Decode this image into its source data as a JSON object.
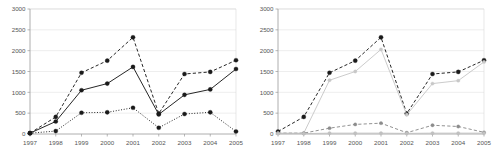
{
  "figure": {
    "panels": [
      "left-chart",
      "right-chart"
    ],
    "background_color": "#ffffff"
  },
  "chart_data": [
    {
      "panel": "left",
      "type": "line",
      "title": "",
      "xlabel": "",
      "ylabel": "",
      "x": [
        "1997",
        "1998",
        "1999",
        "2000",
        "2001",
        "2002",
        "2003",
        "2004",
        "2005"
      ],
      "categories": [
        "1997",
        "1998",
        "1999",
        "2000",
        "2001",
        "2002",
        "2003",
        "2004",
        "2005"
      ],
      "ylim": [
        0,
        3000
      ],
      "yticks": [
        0,
        500,
        1000,
        1500,
        2000,
        2500,
        3000
      ],
      "ytick_labels": [
        "0",
        "500",
        "1000",
        "1500",
        "2000",
        "2500",
        "3000"
      ],
      "grid": true,
      "legend": "none",
      "series": [
        {
          "name": "series-1-dashed",
          "style": "dashed",
          "color": "#1a1a1a",
          "marker": "circle",
          "values": [
            20,
            410,
            1470,
            1760,
            2320,
            490,
            1440,
            1490,
            1770
          ]
        },
        {
          "name": "series-2-solid",
          "style": "solid",
          "color": "#1a1a1a",
          "marker": "circle",
          "values": [
            20,
            300,
            1050,
            1210,
            1610,
            470,
            940,
            1070,
            1560
          ]
        },
        {
          "name": "series-3-dotted",
          "style": "dotted",
          "color": "#1a1a1a",
          "marker": "circle",
          "values": [
            20,
            70,
            510,
            520,
            630,
            150,
            480,
            520,
            60
          ]
        }
      ]
    },
    {
      "panel": "right",
      "type": "line",
      "title": "",
      "xlabel": "",
      "ylabel": "",
      "x": [
        "1997",
        "1998",
        "1999",
        "2000",
        "2001",
        "2002",
        "2003",
        "2004",
        "2005"
      ],
      "categories": [
        "1997",
        "1998",
        "1999",
        "2000",
        "2001",
        "2002",
        "2003",
        "2004",
        "2005"
      ],
      "ylim": [
        0,
        3000
      ],
      "yticks": [
        0,
        500,
        1000,
        1500,
        2000,
        2500,
        3000
      ],
      "ytick_labels": [
        "0",
        "500",
        "1000",
        "1500",
        "2000",
        "2500",
        "3000"
      ],
      "grid": true,
      "legend": "none",
      "series": [
        {
          "name": "series-1-black-dashed",
          "style": "dashed",
          "color": "#1a1a1a",
          "marker": "circle",
          "values": [
            60,
            410,
            1470,
            1760,
            2320,
            490,
            1440,
            1490,
            1770
          ]
        },
        {
          "name": "series-2-lightgray-solid",
          "style": "solid",
          "color": "#c8c8c8",
          "marker": "circle",
          "values": [
            20,
            20,
            1290,
            1500,
            2030,
            460,
            1210,
            1280,
            1730
          ]
        },
        {
          "name": "series-3-gray-dashed",
          "style": "dashed",
          "color": "#8c8c8c",
          "marker": "circle",
          "values": [
            20,
            20,
            140,
            230,
            260,
            30,
            210,
            180,
            40
          ]
        },
        {
          "name": "series-4-lightgray-flat",
          "style": "solid",
          "color": "#c0c0c0",
          "marker": "circle",
          "values": [
            10,
            10,
            20,
            20,
            20,
            15,
            20,
            20,
            20
          ]
        }
      ]
    }
  ]
}
